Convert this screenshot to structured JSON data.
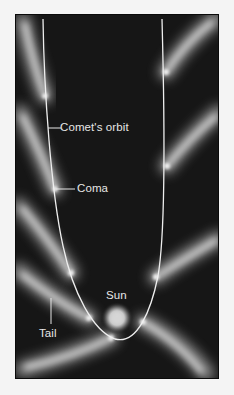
{
  "diagram": {
    "title": "",
    "labels": {
      "orbit": "Comet's orbit",
      "coma": "Coma",
      "sun": "Sun",
      "tail": "Tail"
    },
    "colors": {
      "background": "#161616",
      "page": "#f4f4f4",
      "orbit_line": "#eeeeee",
      "label_text": "#e6e6e6",
      "glow": "#d8d8d8"
    },
    "comet_positions": [
      {
        "side": "left",
        "x": 44,
        "y": 95
      },
      {
        "side": "left",
        "x": 54,
        "y": 188
      },
      {
        "side": "left",
        "x": 70,
        "y": 272
      },
      {
        "side": "left",
        "x": 88,
        "y": 317
      },
      {
        "side": "left",
        "x": 110,
        "y": 337
      },
      {
        "side": "right",
        "x": 165,
        "y": 71
      },
      {
        "side": "right",
        "x": 166,
        "y": 165
      },
      {
        "side": "right",
        "x": 155,
        "y": 276
      },
      {
        "side": "right",
        "x": 142,
        "y": 321
      }
    ]
  }
}
